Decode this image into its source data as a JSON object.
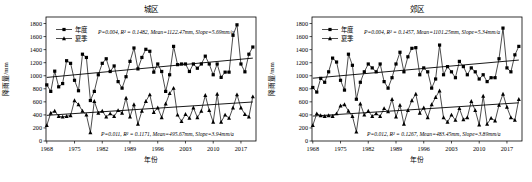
{
  "figure": {
    "background_color": "#ffffff",
    "foreground_color": "#000000"
  },
  "chart_data": [
    {
      "type": "line",
      "title": "城区",
      "xlabel": "年份",
      "ylabel": "降雨量/mm",
      "xlim": [
        1967.8,
        2020.8
      ],
      "ylim": [
        0,
        1900
      ],
      "grid": false,
      "legend_position": "top-left-inside",
      "xticks": [
        1968,
        1975,
        1982,
        1989,
        1996,
        2003,
        2010,
        2017
      ],
      "yticks": [
        0,
        200,
        400,
        600,
        800,
        1000,
        1200,
        1400,
        1600,
        1800
      ],
      "x": [
        1968,
        1969,
        1970,
        1971,
        1972,
        1973,
        1974,
        1975,
        1976,
        1977,
        1978,
        1979,
        1980,
        1981,
        1982,
        1983,
        1984,
        1985,
        1986,
        1987,
        1988,
        1989,
        1990,
        1991,
        1992,
        1993,
        1994,
        1995,
        1996,
        1997,
        1998,
        1999,
        2000,
        2001,
        2002,
        2003,
        2004,
        2005,
        2006,
        2007,
        2008,
        2009,
        2010,
        2011,
        2012,
        2013,
        2014,
        2015,
        2016,
        2017,
        2018,
        2019,
        2020
      ],
      "series": [
        {
          "name": "年度",
          "marker": "square",
          "color": "#000000",
          "values": [
            860,
            760,
            1070,
            830,
            880,
            1230,
            1190,
            930,
            770,
            1330,
            1280,
            620,
            760,
            1015,
            1190,
            1260,
            1065,
            1150,
            910,
            810,
            985,
            1220,
            1425,
            1105,
            1280,
            1405,
            1375,
            1055,
            1180,
            1065,
            760,
            1015,
            1450,
            1170,
            1180,
            1180,
            1065,
            1180,
            1115,
            1180,
            1300,
            1180,
            1015,
            1180,
            975,
            1055,
            1055,
            1620,
            1780,
            1180,
            1060,
            1330,
            1440
          ]
        },
        {
          "name": "夏季",
          "marker": "triangle",
          "color": "#000000",
          "values": [
            240,
            430,
            460,
            380,
            370,
            380,
            390,
            620,
            560,
            460,
            400,
            130,
            610,
            430,
            460,
            370,
            420,
            380,
            470,
            430,
            660,
            370,
            560,
            260,
            460,
            610,
            710,
            440,
            510,
            360,
            570,
            730,
            810,
            400,
            300,
            410,
            350,
            510,
            360,
            460,
            700,
            470,
            290,
            720,
            290,
            400,
            350,
            510,
            710,
            510,
            410,
            370,
            680
          ]
        }
      ],
      "trendlines": [
        {
          "series": "年度",
          "start_year": 1968,
          "end_year": 2020,
          "start_value": 974,
          "end_value": 1270
        },
        {
          "series": "夏季",
          "start_year": 1968,
          "end_year": 2020,
          "start_value": 393,
          "end_value": 598
        }
      ],
      "annotations": [
        {
          "position": "top",
          "text": "P=0.004, R² = 0.1482, Mean=1122.47mm, Slope=5.69mm/a"
        },
        {
          "position": "bottom",
          "text": "P=0.011, R² = 0.1171, Mean=495.67mm, Slope=3.94mm/a"
        }
      ]
    },
    {
      "type": "line",
      "title": "郊区",
      "xlabel": "年份",
      "ylabel": "降雨量/mm",
      "xlim": [
        1967.8,
        2020.8
      ],
      "ylim": [
        0,
        1900
      ],
      "grid": false,
      "legend_position": "top-left-inside",
      "xticks": [
        1968,
        1975,
        1982,
        1989,
        1996,
        2003,
        2010,
        2017
      ],
      "yticks": [
        0,
        200,
        400,
        600,
        800,
        1000,
        1200,
        1400,
        1600,
        1800
      ],
      "x": [
        1968,
        1969,
        1970,
        1971,
        1972,
        1973,
        1974,
        1975,
        1976,
        1977,
        1978,
        1979,
        1980,
        1981,
        1982,
        1983,
        1984,
        1985,
        1986,
        1987,
        1988,
        1989,
        1990,
        1991,
        1992,
        1993,
        1994,
        1995,
        1996,
        1997,
        1998,
        1999,
        2000,
        2001,
        2002,
        2003,
        2004,
        2005,
        2006,
        2007,
        2008,
        2009,
        2010,
        2011,
        2012,
        2013,
        2014,
        2015,
        2016,
        2017,
        2018,
        2019,
        2020
      ],
      "series": [
        {
          "name": "年度",
          "marker": "square",
          "color": "#000000",
          "values": [
            820,
            750,
            960,
            900,
            1060,
            1270,
            1210,
            930,
            780,
            1330,
            1160,
            640,
            900,
            1060,
            1180,
            1120,
            1060,
            1180,
            910,
            810,
            970,
            1180,
            1360,
            1060,
            1290,
            1420,
            1430,
            1015,
            1120,
            1060,
            810,
            950,
            1470,
            1015,
            1140,
            1060,
            970,
            1220,
            1140,
            1015,
            1120,
            1060,
            950,
            1015,
            910,
            970,
            970,
            1260,
            1730,
            1120,
            1060,
            1320,
            1450
          ]
        },
        {
          "name": "夏季",
          "marker": "triangle",
          "color": "#000000",
          "values": [
            240,
            420,
            390,
            380,
            390,
            380,
            420,
            540,
            560,
            460,
            380,
            140,
            570,
            400,
            460,
            380,
            420,
            380,
            500,
            450,
            640,
            370,
            550,
            260,
            470,
            620,
            720,
            430,
            510,
            360,
            560,
            670,
            770,
            360,
            290,
            400,
            320,
            500,
            330,
            360,
            610,
            470,
            250,
            690,
            260,
            350,
            310,
            550,
            720,
            520,
            360,
            320,
            640
          ]
        }
      ],
      "trendlines": [
        {
          "series": "年度",
          "start_year": 1968,
          "end_year": 2020,
          "start_value": 962,
          "end_value": 1240
        },
        {
          "series": "夏季",
          "start_year": 1968,
          "end_year": 2020,
          "start_value": 382,
          "end_value": 585
        }
      ],
      "annotations": [
        {
          "position": "top",
          "text": "P=0.004, R² = 0.1457, Mean=1101.25mm, Slope=5.34mm/a"
        },
        {
          "position": "bottom",
          "text": "P=0.012, R² = 0.1267, Mean=483.45mm, Slope=3.89mm/a"
        }
      ]
    }
  ]
}
